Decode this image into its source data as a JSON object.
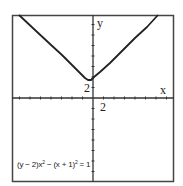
{
  "chart_data": {
    "type": "line",
    "title": "",
    "equation_label": "(y − 2)x² − (x + 1)² = 1",
    "xlabel": "x",
    "ylabel": "y",
    "x_tick_label": "2",
    "y_tick_label": "2",
    "tick_spacing_units": 2,
    "xlim": [
      -16,
      15
    ],
    "ylim": [
      -16,
      16
    ],
    "grid": false,
    "legend": "none",
    "curve_note": "Pixel trace of the drawn curve. The plot does not match the caption: solving the caption gives y = 2 + ((x+1)^2+1)/x^2, which has a vertical asymptote at x=0 and a horizontal asymptote at y=3, whereas the picture shows a V shape with its minimum near (-0.5, ~2.3).",
    "curve_px": [
      [
        19,
        15
      ],
      [
        35,
        30
      ],
      [
        50,
        44
      ],
      [
        62,
        55
      ],
      [
        72,
        65
      ],
      [
        80,
        73
      ],
      [
        85,
        78
      ],
      [
        88,
        80
      ],
      [
        91,
        80
      ],
      [
        94,
        77
      ],
      [
        100,
        72
      ],
      [
        110,
        63
      ],
      [
        122,
        51
      ],
      [
        135,
        38
      ],
      [
        147,
        27
      ],
      [
        158,
        15
      ]
    ]
  },
  "labels": {
    "x": "x",
    "y": "y",
    "x_tick": "2",
    "y_tick": "2",
    "eq_prefix": "(y − 2)x",
    "eq_sup1": "2",
    "eq_mid": " − (x + 1)",
    "eq_sup2": "2",
    "eq_suffix": " = 1"
  }
}
